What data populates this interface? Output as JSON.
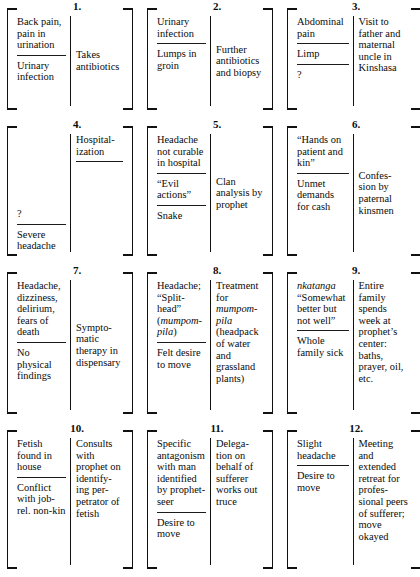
{
  "figure": {
    "type": "diagram",
    "kind": "episode-sequence-bracket-table",
    "columns": 3,
    "rows": 4,
    "cell_count": 12,
    "cell_structure": "each numbered bracket holds a left column of complaints/diagnoses and a right column of therapeutic actions, separated by a vertical rule; horizontal rules divide successive entries",
    "colors": {
      "ink": "#0b0b0b",
      "rule": "#1b1b1b",
      "background": "#ffffff"
    }
  },
  "cells": [
    {
      "number": "1.",
      "left": [
        "Back pain, pain in urination",
        "Urinary infection"
      ],
      "right": [
        "Takes antibiotics"
      ],
      "left_align": "start",
      "right_align": "center"
    },
    {
      "number": "2.",
      "left": [
        "Urinary infection",
        "Lumps in groin"
      ],
      "right": [
        "Further antibiotics and biopsy"
      ],
      "left_align": "start",
      "right_align": "center"
    },
    {
      "number": "3.",
      "left": [
        "Abdominal pain",
        "Limp",
        "?"
      ],
      "right": [
        "Visit to father and maternal uncle in Kinshasa"
      ],
      "left_align": "start",
      "right_align": "start"
    },
    {
      "number": "4.",
      "left": [
        "?",
        "Severe headache"
      ],
      "right": [
        "Hospital-\nization",
        ""
      ],
      "left_align": "end",
      "right_align": "start"
    },
    {
      "number": "5.",
      "left": [
        "Headache not curable in hospital",
        "“Evil actions”",
        "Snake"
      ],
      "right": [
        "Clan analysis by prophet"
      ],
      "left_align": "start",
      "right_align": "center"
    },
    {
      "number": "6.",
      "left": [
        "“Hands on patient and kin”",
        "Unmet demands for cash"
      ],
      "right": [
        "Confes-\nsion by paternal kinsmen"
      ],
      "left_align": "start",
      "right_align": "center"
    },
    {
      "number": "7.",
      "left": [
        "Headache, dizziness, delirium, fears of death",
        "No physical findings"
      ],
      "right": [
        "Sympto-\nmatic therapy in dispensary"
      ],
      "left_align": "start",
      "right_align": "center"
    },
    {
      "number": "8.",
      "left": [
        "Headache; “Split-head” (mumpom-pila)",
        "Felt desire to move"
      ],
      "left_italic_fragment": "mumpom-pila",
      "right": [
        "Treatment for mumpom-pila (headpack of water and grassland plants)"
      ],
      "right_italic_fragment": "mumpom-pila",
      "left_align": "start",
      "right_align": "start"
    },
    {
      "number": "9.",
      "left": [
        "nkatanga “Somewhat better but not well”",
        "Whole family sick"
      ],
      "left_italic_fragment": "nkatanga",
      "right": [
        "Entire family spends week at prophet’s center: baths, prayer, oil, etc."
      ],
      "left_align": "start",
      "right_align": "start"
    },
    {
      "number": "10.",
      "left": [
        "Fetish found in house",
        "Conflict with job-rel. non-kin"
      ],
      "right": [
        "Consults with prophet on identify-\ning per-\npetrator of fetish"
      ],
      "left_align": "start",
      "right_align": "start"
    },
    {
      "number": "11.",
      "left": [
        "Specific antagonism with man identified by prophet-\nseer",
        "Desire to move"
      ],
      "right": [
        "Delega-\ntion on behalf of sufferer works out truce"
      ],
      "left_align": "start",
      "right_align": "start"
    },
    {
      "number": "12.",
      "left": [
        "Slight headache",
        "Desire to move"
      ],
      "right": [
        "Meeting and extended retreat for profes-\nsional peers of sufferer; move okayed"
      ],
      "left_align": "start",
      "right_align": "start"
    }
  ]
}
